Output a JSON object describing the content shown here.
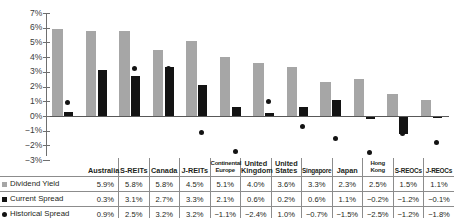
{
  "chart_data": {
    "type": "bar",
    "title": "",
    "xlabel": "",
    "ylabel": "",
    "ylim": [
      -3,
      7
    ],
    "yticks": [
      "7%",
      "6%",
      "5%",
      "4%",
      "3%",
      "2%",
      "1%",
      "0%",
      "−1%",
      "−2%",
      "−3%"
    ],
    "grid": false,
    "legend_position": "table-row-labels",
    "categories": [
      "Australia",
      "S-REITs",
      "Canada",
      "J-REITs",
      "Continental Europe",
      "United Kingdom",
      "United States",
      "Singapore",
      "Japan",
      "Hong Kong",
      "S-REOCs",
      "J-REOCs"
    ],
    "series": [
      {
        "name": "Dividend Yield",
        "marker": "gray-square",
        "color": "#a6a6a6",
        "type": "bar",
        "values": [
          5.9,
          5.8,
          5.8,
          4.5,
          5.1,
          4.0,
          3.6,
          3.3,
          2.3,
          2.5,
          1.5,
          1.1
        ],
        "labels": [
          "5.9%",
          "5.8%",
          "5.8%",
          "4.5%",
          "5.1%",
          "4.0%",
          "3.6%",
          "3.3%",
          "2.3%",
          "2.5%",
          "1.5%",
          "1.1%"
        ]
      },
      {
        "name": "Current Spread",
        "marker": "black-square",
        "color": "#131313",
        "type": "bar",
        "values": [
          0.3,
          3.1,
          2.7,
          3.3,
          2.1,
          0.6,
          0.2,
          0.6,
          1.1,
          -0.2,
          -1.2,
          -0.1
        ],
        "labels": [
          "0.3%",
          "3.1%",
          "2.7%",
          "3.3%",
          "2.1%",
          "0.6%",
          "0.2%",
          "0.6%",
          "1.1%",
          "−0.2%",
          "−1.2%",
          "−0.1%"
        ]
      },
      {
        "name": "Historical Spread",
        "marker": "black-circle",
        "color": "#131313",
        "type": "scatter",
        "values": [
          0.9,
          2.5,
          3.2,
          3.2,
          -1.1,
          -2.4,
          1.0,
          -0.7,
          -1.5,
          -2.5,
          -1.2,
          -1.8
        ],
        "labels": [
          "0.9%",
          "2.5%",
          "3.2%",
          "3.2%",
          "−1.1%",
          "−2.4%",
          "1.0%",
          "−0.7%",
          "−1.5%",
          "−2.5%",
          "−1.2%",
          "−1.8%"
        ]
      }
    ]
  }
}
